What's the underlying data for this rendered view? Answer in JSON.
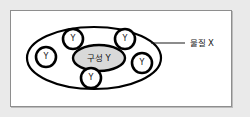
{
  "figure": {
    "type": "diagram",
    "frame": {
      "background_color": "#eaeaea",
      "panel_color": "#ffffff",
      "panel_border_color": "#8e8e8e"
    }
  },
  "outer_shape": {
    "name": "substance-ellipse",
    "stroke_color": "#000000",
    "fill_color": "#ffffff",
    "cx": 94,
    "cy": 58,
    "rx": 67,
    "ry": 31
  },
  "core": {
    "name": "composition-ellipse",
    "label": "구성 Y",
    "fill_color": "#d9d9d9",
    "stroke_color": "#000000",
    "cx": 99,
    "cy": 58,
    "rx": 26,
    "ry": 13
  },
  "particles": [
    {
      "label": "Y",
      "cx": 46,
      "cy": 57,
      "r": 10
    },
    {
      "label": "Y",
      "cx": 73,
      "cy": 39,
      "r": 10
    },
    {
      "label": "Y",
      "cx": 125,
      "cy": 39,
      "r": 10
    },
    {
      "label": "Y",
      "cx": 142,
      "cy": 63,
      "r": 10
    },
    {
      "label": "Y",
      "cx": 91,
      "cy": 78,
      "r": 10
    }
  ],
  "callout": {
    "name": "substance-x-callout",
    "label": "물질 X",
    "line": {
      "x1": 151,
      "y1": 43,
      "x2": 185,
      "y2": 43
    },
    "text_x": 190,
    "text_y": 43,
    "stroke_color": "#1a1a1a"
  }
}
